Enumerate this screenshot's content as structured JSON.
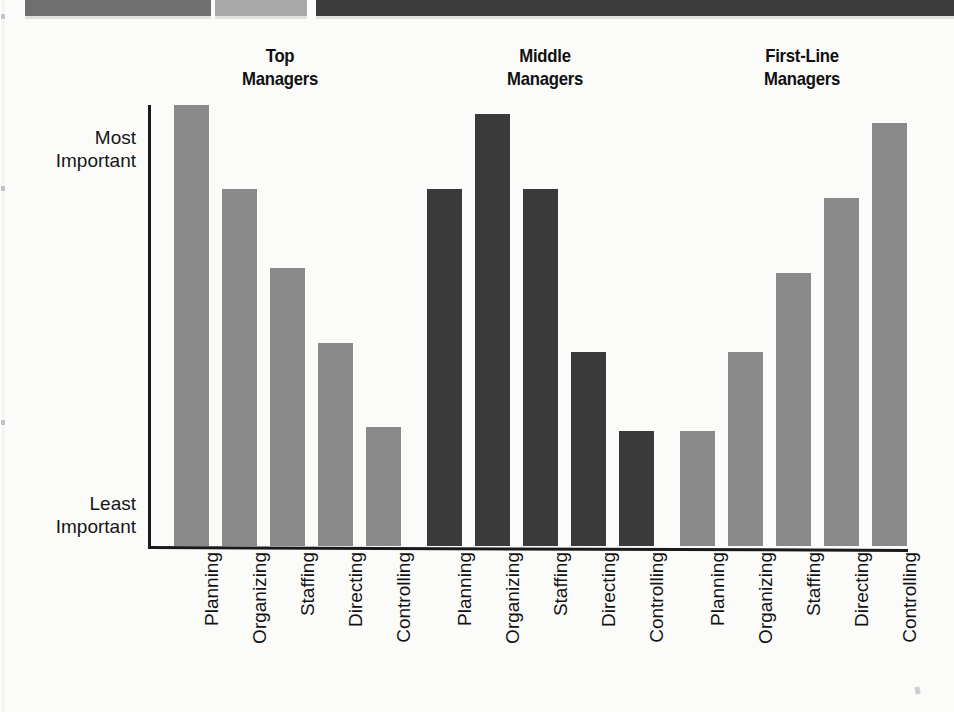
{
  "banner": {
    "name": "decorative-top-banner",
    "segments": [
      {
        "name": "band-gray-medium",
        "left": 25,
        "width": 186,
        "color": "#6f6f6f"
      },
      {
        "name": "band-gray-light",
        "left": 215,
        "width": 92,
        "color": "#a8a8a8"
      },
      {
        "name": "band-charcoal",
        "left": 316,
        "width": 638,
        "color": "#3b3b3b"
      }
    ]
  },
  "axis": {
    "y_top_label": "Most\nImportant",
    "y_top_label_line1": "Most",
    "y_top_label_line2": "Important",
    "y_bottom_label_line1": "Least",
    "y_bottom_label_line2": "Important"
  },
  "chart_data": {
    "type": "bar",
    "title": "",
    "subtitle": "",
    "xlabel": "",
    "ylabel": "",
    "grid": false,
    "legend_position": "none",
    "categories": [
      "Planning",
      "Organizing",
      "Staffing",
      "Directing",
      "Controlling"
    ],
    "ylim": [
      0,
      1
    ],
    "ytick_labels": [
      "Least Important",
      "Most Important"
    ],
    "group_labels": [
      "Top Managers",
      "Middle Managers",
      "First-Line Managers"
    ],
    "group_label_lines": [
      [
        "Top",
        "Managers"
      ],
      [
        "Middle",
        "Managers"
      ],
      [
        "First-Line",
        "Managers"
      ]
    ],
    "series": [
      {
        "name": "Top Managers",
        "color": "#8a8a8a",
        "values": [
          1.0,
          0.81,
          0.63,
          0.46,
          0.27
        ]
      },
      {
        "name": "Middle Managers",
        "color": "#3a3a3a",
        "values": [
          0.81,
          0.98,
          0.81,
          0.44,
          0.26
        ]
      },
      {
        "name": "First-Line Managers",
        "color": "#8a8a8a",
        "values": [
          0.26,
          0.44,
          0.62,
          0.79,
          0.96
        ]
      }
    ],
    "annotations": []
  },
  "layout": {
    "bar_width": 35,
    "bar_pitch": 48,
    "group_gap": 13,
    "plot_height": 441,
    "group_heading_left": [
      190,
      455,
      712
    ]
  }
}
